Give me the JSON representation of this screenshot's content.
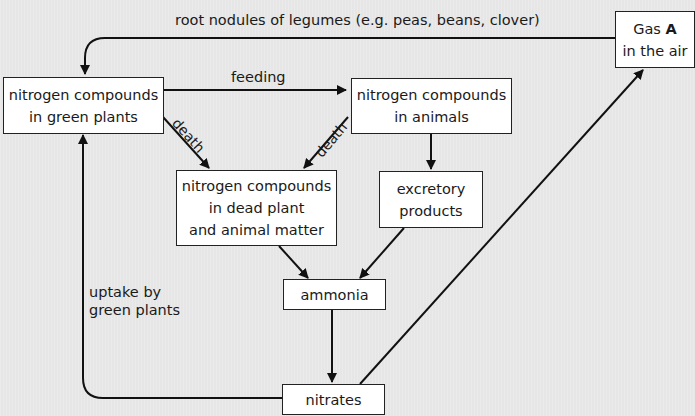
{
  "diagram": {
    "nodes": {
      "gas_a": {
        "line1_prefix": "Gas ",
        "line1_bold": "A",
        "line2": "in the air"
      },
      "green_plants": {
        "line1": "nitrogen compounds",
        "line2": "in green plants"
      },
      "animals": {
        "line1": "nitrogen compounds",
        "line2": "in animals"
      },
      "dead_matter": {
        "line1": "nitrogen compounds",
        "line2": "in dead plant",
        "line3": "and animal matter"
      },
      "excretory": {
        "line1": "excretory",
        "line2": "products"
      },
      "ammonia": {
        "line1": "ammonia"
      },
      "nitrates": {
        "line1": "nitrates"
      }
    },
    "edges": {
      "root_nodules": "root nodules of legumes (e.g. peas, beans, clover)",
      "feeding": "feeding",
      "death_plants": "death",
      "death_animals": "death",
      "uptake_line1": "uptake by",
      "uptake_line2": "green plants"
    },
    "colors": {
      "line": "#111111",
      "box_fill": "#ffffff",
      "background": "#e6e6e6"
    }
  }
}
